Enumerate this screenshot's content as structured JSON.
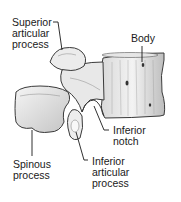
{
  "labels": {
    "superior_articular_process": [
      "Superior",
      "articular",
      "process"
    ],
    "body": [
      "Body"
    ],
    "inferior_notch": [
      "Inferior",
      "notch"
    ],
    "spinous_process": [
      "Spinous",
      "process"
    ],
    "inferior_articular_process": [
      "Inferior",
      "articular",
      "process"
    ]
  },
  "colors": {
    "bone_fill": "#efefef",
    "bone_shade": "#c9c9c9",
    "outline": "#3a3a3a",
    "text": "#1a1a1a"
  }
}
